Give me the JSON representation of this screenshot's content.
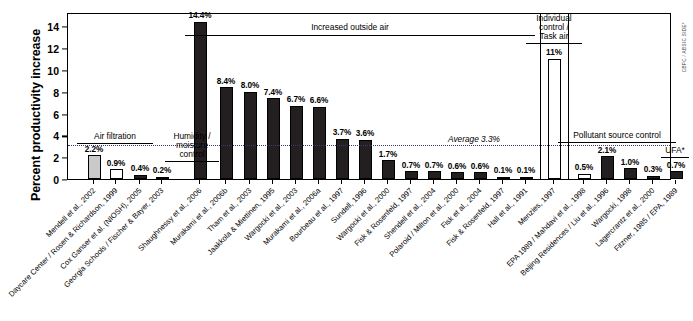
{
  "axis": {
    "y_title": "Percent productivity increase",
    "y_ticks": [
      "0",
      "2",
      "4",
      "6",
      "8",
      "10",
      "12",
      "14"
    ]
  },
  "annotations": {
    "air_filtration": "Air filtration",
    "humidity": "Humidity /\nmoisture\ncontrol",
    "outside_air": "Increased outside air",
    "individual_control": "Individual\ncontrol /\nTask air",
    "pollutant_control": "Pollutant source control",
    "ufa": "UFA*",
    "average": "Average 3.3%",
    "credit": "CBPC / ABSIC SIDE*"
  },
  "chart_data": {
    "type": "bar",
    "title": "",
    "xlabel": "",
    "ylabel": "Percent productivity increase",
    "ylim": [
      0,
      15.3
    ],
    "grid": false,
    "legend": "none",
    "average_line": 3.3,
    "categories": [
      "Mendell et al., 2002",
      "Daycare Center / Rosen & Richardson, 1999",
      "Cox Ganser et al. (NIOSH), 2005",
      "Georgia Schools / Fischer & Bayer, 2003",
      "Shaughnessy et al., 2006",
      "Murakami et al., 2006b",
      "Tham et al., 2003",
      "Jaakkola & Miettinen, 1995",
      "Wargocki et al., 2003",
      "Murakami et al., 2006a",
      "Bourbeau et al., 1997",
      "Sundell, 1996",
      "Wargocki et al., 2000",
      "Fisk & Rosenfeld, 1997",
      "Shendell et al., 2004",
      "Polaroid / Milton et al., 2000",
      "Fisk et al., 2004",
      "Fisk & Rosenfeld, 1997",
      "Hall et al., 1991",
      "Menzies, 1997",
      "EPA 1989 / Mahdavi et al., 1998",
      "Beijing Residences / Liu et al., 1996",
      "Wargocki, 1998",
      "Lagercrantz et al., 2000",
      "Fitzner, 1985 / EPA, 1989"
    ],
    "values": [
      2.2,
      0.9,
      0.4,
      0.2,
      14.4,
      8.4,
      8.0,
      7.4,
      6.7,
      6.6,
      3.7,
      3.6,
      1.7,
      0.7,
      0.7,
      0.6,
      0.6,
      0.1,
      0.1,
      11.0,
      0.5,
      2.1,
      1.0,
      0.3,
      0.7
    ],
    "value_labels": [
      "2.2%",
      "0.9%",
      "0.4%",
      "0.2%",
      "14.4%",
      "8.4%",
      "8.0%",
      "7.4%",
      "6.7%",
      "6.6%",
      "3.7%",
      "3.6%",
      "1.7%",
      "0.7%",
      "0.7%",
      "0.6%",
      "0.6%",
      "0.1%",
      "0.1%",
      "11%",
      "0.5%",
      "2.1%",
      "1.0%",
      "0.3%",
      "0.7%"
    ],
    "fills": [
      "gray",
      "white",
      "dark",
      "dark",
      "dark",
      "dark",
      "dark",
      "dark",
      "dark",
      "dark",
      "dark",
      "dark",
      "dark",
      "dark",
      "dark",
      "dark",
      "dark",
      "dark",
      "dark",
      "white",
      "white",
      "dark",
      "dark",
      "dark",
      "dark"
    ],
    "groups": [
      {
        "label": "Air filtration",
        "from": 0,
        "to": 1
      },
      {
        "label": "Humidity / moisture control",
        "from": 2,
        "to": 3
      },
      {
        "label": "Increased outside air",
        "from": 4,
        "to": 18
      },
      {
        "label": "Individual control / Task air",
        "from": 19,
        "to": 19
      },
      {
        "label": "Pollutant source control",
        "from": 20,
        "to": 23
      },
      {
        "label": "UFA*",
        "from": 24,
        "to": 24
      }
    ]
  }
}
